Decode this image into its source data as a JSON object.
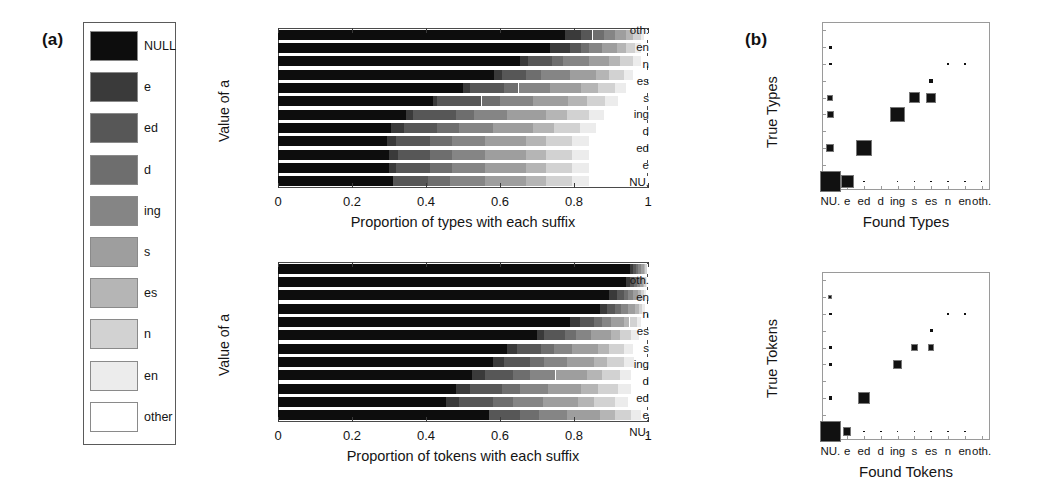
{
  "panels": {
    "a_letter": "(a)",
    "b_letter": "(b)"
  },
  "legend": {
    "items": [
      {
        "label": "NULL",
        "color": "#0d0d0d"
      },
      {
        "label": "e",
        "color": "#3a3a3a"
      },
      {
        "label": "ed",
        "color": "#575757"
      },
      {
        "label": "d",
        "color": "#6e6e6e"
      },
      {
        "label": "ing",
        "color": "#858585"
      },
      {
        "label": "s",
        "color": "#9e9e9e"
      },
      {
        "label": "es",
        "color": "#b5b5b5"
      },
      {
        "label": "n",
        "color": "#d2d2d2"
      },
      {
        "label": "en",
        "color": "#ececec"
      },
      {
        "label": "other",
        "color": "#ffffff"
      }
    ]
  },
  "chart_data": [
    {
      "id": "types-bars",
      "type": "bar",
      "orientation": "horizontal",
      "stacked": true,
      "title": "",
      "xlabel": "Proportion of types with each suffix",
      "ylabel": "Value of a",
      "xlim": [
        0,
        1
      ],
      "xticks": [
        0,
        0.2,
        0.4,
        0.6,
        0.8,
        1
      ],
      "xticklabels": [
        "0",
        "0.2",
        "0.4",
        "0.6",
        "0.8",
        "1"
      ],
      "grid": false,
      "legend_position": "external-left",
      "categories": [
        "1",
        "0.9",
        "0.8",
        "0.7",
        "0.6",
        "0.5",
        "0.4",
        "0.3",
        "0.2",
        "0.1",
        "0",
        "(true dist)"
      ],
      "series": [
        {
          "name": "NULL",
          "color": "#0d0d0d",
          "values": [
            0.775,
            0.735,
            0.655,
            0.585,
            0.5,
            0.42,
            0.345,
            0.305,
            0.295,
            0.3,
            0.3,
            0.31
          ]
        },
        {
          "name": "e",
          "color": "#3a3a3a",
          "values": [
            0.045,
            0.055,
            0.02,
            0.02,
            0.02,
            0.01,
            0.02,
            0.035,
            0.025,
            0.025,
            0.02,
            0.0
          ]
        },
        {
          "name": "ed",
          "color": "#575757",
          "values": [
            0.03,
            0.03,
            0.065,
            0.065,
            0.09,
            0.12,
            0.115,
            0.09,
            0.09,
            0.085,
            0.09,
            0.095
          ]
        },
        {
          "name": "d",
          "color": "#6e6e6e",
          "values": [
            0.03,
            0.02,
            0.03,
            0.04,
            0.04,
            0.05,
            0.05,
            0.06,
            0.06,
            0.06,
            0.06,
            0.06
          ]
        },
        {
          "name": "ing",
          "color": "#858585",
          "values": [
            0.03,
            0.035,
            0.07,
            0.08,
            0.085,
            0.09,
            0.09,
            0.09,
            0.09,
            0.09,
            0.09,
            0.095
          ]
        },
        {
          "name": "s",
          "color": "#9e9e9e",
          "values": [
            0.03,
            0.04,
            0.055,
            0.07,
            0.085,
            0.095,
            0.105,
            0.11,
            0.11,
            0.11,
            0.11,
            0.11
          ]
        },
        {
          "name": "es",
          "color": "#b5b5b5",
          "values": [
            0.02,
            0.025,
            0.03,
            0.035,
            0.045,
            0.05,
            0.055,
            0.055,
            0.055,
            0.055,
            0.055,
            0.055
          ]
        },
        {
          "name": "n",
          "color": "#d2d2d2",
          "values": [
            0.02,
            0.025,
            0.035,
            0.04,
            0.045,
            0.05,
            0.06,
            0.07,
            0.07,
            0.07,
            0.07,
            0.07
          ]
        },
        {
          "name": "en",
          "color": "#ececec",
          "values": [
            0.01,
            0.015,
            0.02,
            0.025,
            0.03,
            0.035,
            0.04,
            0.045,
            0.045,
            0.045,
            0.045,
            0.045
          ]
        },
        {
          "name": "other",
          "color": "#ffffff",
          "values": [
            0.01,
            0.02,
            0.02,
            0.04,
            0.06,
            0.08,
            0.12,
            0.14,
            0.16,
            0.16,
            0.16,
            0.16
          ]
        }
      ]
    },
    {
      "id": "tokens-bars",
      "type": "bar",
      "orientation": "horizontal",
      "stacked": true,
      "title": "",
      "xlabel": "Proportion of tokens with each suffix",
      "ylabel": "Value of a",
      "xlim": [
        0,
        1
      ],
      "xticks": [
        0,
        0.2,
        0.4,
        0.6,
        0.8,
        1
      ],
      "xticklabels": [
        "0",
        "0.2",
        "0.4",
        "0.6",
        "0.8",
        "1"
      ],
      "grid": false,
      "legend_position": "external-left",
      "categories": [
        "1",
        "0.9",
        "0.8",
        "0.7",
        "0.6",
        "0.5",
        "0.4",
        "0.3",
        "0.2",
        "0.1",
        "0",
        "(true dist)"
      ],
      "series": [
        {
          "name": "NULL",
          "color": "#0d0d0d",
          "values": [
            0.95,
            0.94,
            0.895,
            0.87,
            0.79,
            0.7,
            0.62,
            0.58,
            0.525,
            0.48,
            0.455,
            0.57
          ]
        },
        {
          "name": "e",
          "color": "#3a3a3a",
          "values": [
            0.01,
            0.012,
            0.02,
            0.02,
            0.025,
            0.02,
            0.025,
            0.03,
            0.035,
            0.04,
            0.035,
            0.0
          ]
        },
        {
          "name": "ed",
          "color": "#575757",
          "values": [
            0.008,
            0.01,
            0.02,
            0.022,
            0.04,
            0.055,
            0.065,
            0.07,
            0.075,
            0.085,
            0.09,
            0.085
          ]
        },
        {
          "name": "d",
          "color": "#6e6e6e",
          "values": [
            0.006,
            0.008,
            0.012,
            0.015,
            0.02,
            0.03,
            0.035,
            0.04,
            0.045,
            0.05,
            0.055,
            0.05
          ]
        },
        {
          "name": "ing",
          "color": "#858585",
          "values": [
            0.006,
            0.008,
            0.012,
            0.018,
            0.025,
            0.04,
            0.05,
            0.06,
            0.07,
            0.075,
            0.08,
            0.075
          ]
        },
        {
          "name": "s",
          "color": "#9e9e9e",
          "values": [
            0.008,
            0.008,
            0.015,
            0.02,
            0.035,
            0.055,
            0.07,
            0.075,
            0.085,
            0.09,
            0.095,
            0.09
          ]
        },
        {
          "name": "es",
          "color": "#b5b5b5",
          "values": [
            0.004,
            0.004,
            0.008,
            0.01,
            0.015,
            0.025,
            0.03,
            0.035,
            0.04,
            0.045,
            0.045,
            0.04
          ]
        },
        {
          "name": "n",
          "color": "#d2d2d2",
          "values": [
            0.004,
            0.005,
            0.008,
            0.01,
            0.02,
            0.03,
            0.04,
            0.045,
            0.05,
            0.055,
            0.055,
            0.045
          ]
        },
        {
          "name": "en",
          "color": "#ececec",
          "values": [
            0.002,
            0.003,
            0.005,
            0.008,
            0.012,
            0.02,
            0.025,
            0.028,
            0.03,
            0.035,
            0.035,
            0.025
          ]
        },
        {
          "name": "other",
          "color": "#ffffff",
          "values": [
            0.002,
            0.002,
            0.005,
            0.007,
            0.018,
            0.025,
            0.04,
            0.037,
            0.045,
            0.045,
            0.055,
            0.02
          ]
        }
      ]
    },
    {
      "id": "types-matrix",
      "type": "heatmap",
      "style": "hinton",
      "title": "",
      "xlabel": "Found Types",
      "ylabel": "True Types",
      "xticklabels": [
        "NU.",
        "e",
        "ed",
        "d",
        "ing",
        "s",
        "es",
        "n",
        "en",
        "oth."
      ],
      "yticklabels": [
        "NU.",
        "e",
        "ed",
        "d",
        "ing",
        "s",
        "es",
        "n",
        "en",
        "oth."
      ],
      "grid": false,
      "cells": [
        {
          "row": "NU.",
          "col": "NU.",
          "size": 1.0
        },
        {
          "row": "NU.",
          "col": "e",
          "size": 0.62
        },
        {
          "row": "NU.",
          "col": "ed",
          "size": 0.07
        },
        {
          "row": "NU.",
          "col": "ing",
          "size": 0.07
        },
        {
          "row": "NU.",
          "col": "s",
          "size": 0.07
        },
        {
          "row": "NU.",
          "col": "es",
          "size": 0.07
        },
        {
          "row": "NU.",
          "col": "n",
          "size": 0.07
        },
        {
          "row": "NU.",
          "col": "en",
          "size": 0.05
        },
        {
          "row": "NU.",
          "col": "oth.",
          "size": 0.05
        },
        {
          "row": "ed",
          "col": "NU.",
          "size": 0.38
        },
        {
          "row": "ed",
          "col": "ed",
          "size": 0.72
        },
        {
          "row": "ing",
          "col": "NU.",
          "size": 0.33
        },
        {
          "row": "ing",
          "col": "ing",
          "size": 0.68
        },
        {
          "row": "s",
          "col": "NU.",
          "size": 0.28
        },
        {
          "row": "s",
          "col": "s",
          "size": 0.5
        },
        {
          "row": "s",
          "col": "es",
          "size": 0.48
        },
        {
          "row": "es",
          "col": "es",
          "size": 0.17
        },
        {
          "row": "n",
          "col": "NU.",
          "size": 0.14
        },
        {
          "row": "n",
          "col": "n",
          "size": 0.1
        },
        {
          "row": "n",
          "col": "en",
          "size": 0.12
        },
        {
          "row": "en",
          "col": "NU.",
          "size": 0.13
        }
      ]
    },
    {
      "id": "tokens-matrix",
      "type": "heatmap",
      "style": "hinton",
      "title": "",
      "xlabel": "Found Tokens",
      "ylabel": "True Tokens",
      "xticklabels": [
        "NU.",
        "e",
        "ed",
        "d",
        "ing",
        "s",
        "es",
        "n",
        "en",
        "oth."
      ],
      "yticklabels": [
        "NU.",
        "e",
        "ed",
        "d",
        "ing",
        "s",
        "es",
        "n",
        "en",
        "oth."
      ],
      "grid": false,
      "cells": [
        {
          "row": "NU.",
          "col": "NU.",
          "size": 1.0
        },
        {
          "row": "NU.",
          "col": "e",
          "size": 0.4
        },
        {
          "row": "NU.",
          "col": "ed",
          "size": 0.06
        },
        {
          "row": "NU.",
          "col": "d",
          "size": 0.06
        },
        {
          "row": "NU.",
          "col": "ing",
          "size": 0.06
        },
        {
          "row": "NU.",
          "col": "s",
          "size": 0.06
        },
        {
          "row": "NU.",
          "col": "es",
          "size": 0.06
        },
        {
          "row": "NU.",
          "col": "n",
          "size": 0.05
        },
        {
          "row": "NU.",
          "col": "en",
          "size": 0.05
        },
        {
          "row": "ed",
          "col": "NU.",
          "size": 0.18
        },
        {
          "row": "ed",
          "col": "ed",
          "size": 0.56
        },
        {
          "row": "ing",
          "col": "NU.",
          "size": 0.16
        },
        {
          "row": "ing",
          "col": "ing",
          "size": 0.46
        },
        {
          "row": "s",
          "col": "NU.",
          "size": 0.13
        },
        {
          "row": "s",
          "col": "s",
          "size": 0.36
        },
        {
          "row": "s",
          "col": "es",
          "size": 0.3
        },
        {
          "row": "es",
          "col": "es",
          "size": 0.14
        },
        {
          "row": "n",
          "col": "NU.",
          "size": 0.11
        },
        {
          "row": "n",
          "col": "n",
          "size": 0.09
        },
        {
          "row": "n",
          "col": "en",
          "size": 0.1
        },
        {
          "row": "en",
          "col": "NU.",
          "size": 0.2
        }
      ]
    }
  ]
}
